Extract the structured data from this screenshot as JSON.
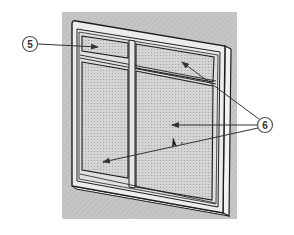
{
  "diagram": {
    "colors": {
      "background": "#ffffff",
      "backdrop": "#c4c4c4",
      "frame_fill": "#e6e6e6",
      "frame_stroke": "#1e1e1e",
      "glass_fill": "#d2d2d2",
      "glass_dot": "#a8a8a8",
      "arrow": "#333333",
      "callout_fill": "#ffffff",
      "callout_stroke": "#555555"
    },
    "callouts": [
      {
        "id": "5",
        "label": "5",
        "points_to": "upper-left transom pane"
      },
      {
        "id": "6",
        "label": "6",
        "points_to": [
          "upper-right transom pane",
          "lower-right sash pane",
          "lower-left sash pane"
        ]
      }
    ],
    "panes": [
      {
        "name": "upper-left-transom"
      },
      {
        "name": "upper-right-transom"
      },
      {
        "name": "lower-left-sash"
      },
      {
        "name": "lower-right-sash"
      }
    ]
  }
}
